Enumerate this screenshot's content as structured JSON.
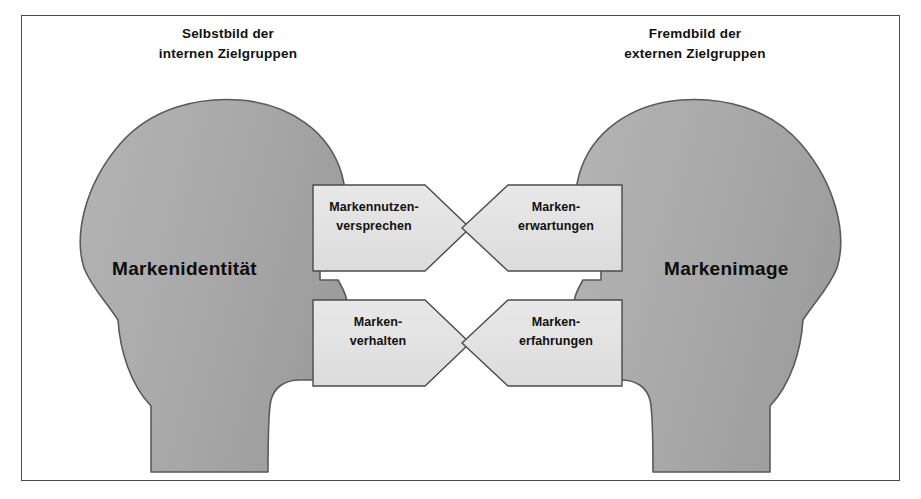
{
  "diagram": {
    "title_left": "Selbstbild der\ninternen Zielgruppen",
    "title_right": "Fremdbild der\nexternen Zielgruppen",
    "left_head_label": "Markenidentität",
    "right_head_label": "Markenimage",
    "arrows": [
      {
        "id": "markennutzenversprechen",
        "label": "Markennutzen-\nversprechen",
        "direction": "left-to-right",
        "row": "top"
      },
      {
        "id": "markenerwartungen",
        "label": "Marken-\nerwartungen",
        "direction": "right-to-left",
        "row": "top"
      },
      {
        "id": "markenverhalten",
        "label": "Marken-\nverhalten",
        "direction": "left-to-right",
        "row": "bottom"
      },
      {
        "id": "markenerfahrungen",
        "label": "Marken-\nerfahrungen",
        "direction": "right-to-left",
        "row": "bottom"
      }
    ],
    "colors": {
      "head_fill": "#a8a8a8",
      "head_stroke": "#5a5a5a",
      "arrow_fill": "#e2e2e2",
      "arrow_stroke": "#4b4b4b",
      "frame_stroke": "#4a4a4a",
      "text": "#111111",
      "background": "#ffffff"
    }
  }
}
